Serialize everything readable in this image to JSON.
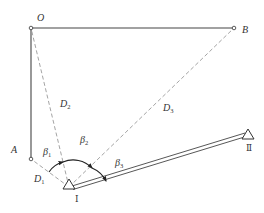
{
  "diagram": {
    "colors": {
      "solid_line": "#444444",
      "dashed_line": "#9a9a9a",
      "text": "#333333",
      "background": "#ffffff"
    },
    "points": {
      "O": {
        "label": "O",
        "x": 31,
        "y": 28
      },
      "B": {
        "label": "B",
        "x": 234,
        "y": 28
      },
      "A": {
        "label": "A",
        "x": 31,
        "y": 159
      },
      "station1": {
        "label": "Ⅰ",
        "x": 69,
        "y": 187
      },
      "station2": {
        "label": "Ⅱ",
        "x": 248,
        "y": 134
      }
    },
    "distances": {
      "d1": {
        "main": "D",
        "sub": "1"
      },
      "d2": {
        "main": "D",
        "sub": "2"
      },
      "d3": {
        "main": "D",
        "sub": "3"
      }
    },
    "angles": {
      "b1": {
        "main": "β",
        "sub": "1"
      },
      "b2": {
        "main": "β",
        "sub": "2"
      },
      "b3": {
        "main": "β",
        "sub": "3"
      }
    },
    "edges": [
      {
        "from": "O",
        "to": "B",
        "style": "solid"
      },
      {
        "from": "O",
        "to": "A",
        "style": "solid"
      },
      {
        "from": "station1",
        "to": "A",
        "style": "dashed",
        "label": "D1"
      },
      {
        "from": "station1",
        "to": "O",
        "style": "dashed",
        "label": "D2"
      },
      {
        "from": "station1",
        "to": "B",
        "style": "dashed",
        "label": "D3"
      },
      {
        "from": "station1",
        "to": "station2",
        "style": "double",
        "label": "traverse baseline"
      }
    ]
  }
}
